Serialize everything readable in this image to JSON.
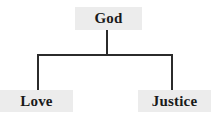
{
  "diagram": {
    "type": "tree",
    "canvas": {
      "width": 211,
      "height": 114,
      "background": "#ffffff"
    },
    "colors": {
      "node_fill": "#ececec",
      "node_text": "#1a1a1a",
      "connector": "#2b2b2b"
    },
    "nodes": {
      "root": {
        "label": "God",
        "x": 75,
        "y": 7,
        "width": 67,
        "height": 23
      },
      "left": {
        "label": "Love",
        "x": 0,
        "y": 90,
        "width": 73,
        "height": 22
      },
      "right": {
        "label": "Justice",
        "x": 138,
        "y": 90,
        "width": 73,
        "height": 22
      }
    },
    "edges": [
      {
        "from": "root",
        "to": "left",
        "label": ""
      },
      {
        "from": "root",
        "to": "right",
        "label": ""
      }
    ],
    "connector_geometry": {
      "stem_x": 107,
      "stem_top": 30,
      "bus_y": 55,
      "bus_left_x": 38,
      "bus_right_x": 172,
      "drop_bottom": 90,
      "stroke_width": 2
    }
  }
}
